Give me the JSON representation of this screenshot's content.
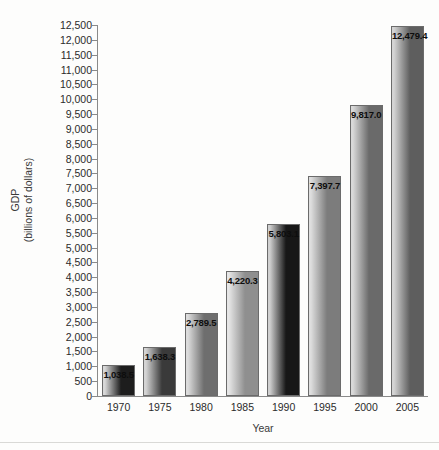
{
  "chart_data": {
    "type": "bar",
    "title": "",
    "xlabel": "Year",
    "ylabel_line1": "GDP",
    "ylabel_line2": "(billions of dollars)",
    "categories": [
      "1970",
      "1975",
      "1980",
      "1985",
      "1990",
      "1995",
      "2000",
      "2005"
    ],
    "values": [
      1038.5,
      1638.3,
      2789.5,
      4220.3,
      5803.1,
      7397.7,
      9817.0,
      12479.4
    ],
    "value_labels": [
      "1,038.5",
      "1,638.3",
      "2,789.5",
      "4,220.3",
      "5,803.1",
      "7,397.7",
      "9,817.0",
      "12,479.4"
    ],
    "ylim": [
      0,
      12500
    ],
    "ytick_step": 500,
    "ytick_labels": [
      "12,500",
      "12,000",
      "11,500",
      "11,000",
      "10,500",
      "10,000",
      "9,500",
      "9,000",
      "8,500",
      "8,000",
      "7,500",
      "7,000",
      "6,500",
      "6,000",
      "5,500",
      "5,000",
      "4,500",
      "4,000",
      "3,500",
      "3,000",
      "2,500",
      "2,000",
      "1,500",
      "1,000",
      "500",
      "0"
    ],
    "ytick_values": [
      12500,
      12000,
      11500,
      11000,
      10500,
      10000,
      9500,
      9000,
      8500,
      8000,
      7500,
      7000,
      6500,
      6000,
      5500,
      5000,
      4500,
      4000,
      3500,
      3000,
      2500,
      2000,
      1500,
      1000,
      500,
      0
    ],
    "grid": false,
    "legend": null,
    "bar_fill_style": "horizontal-gradient-grayscale",
    "bar_colors": [
      {
        "light": "#d8d8d8",
        "dark": "#1d1d1d"
      },
      {
        "light": "#d4d4d4",
        "dark": "#3a3a3a"
      },
      {
        "light": "#dcdcdc",
        "dark": "#6e6e6e"
      },
      {
        "light": "#e6e6e6",
        "dark": "#8f8f8f"
      },
      {
        "light": "#d0d0d0",
        "dark": "#171717"
      },
      {
        "light": "#dedede",
        "dark": "#7c7c7c"
      },
      {
        "light": "#d9d9d9",
        "dark": "#6a6a6a"
      },
      {
        "light": "#d4d4d4",
        "dark": "#5e5e5e"
      }
    ],
    "colors": {
      "axis": "#8a8a8a",
      "bar_border": "#6b6b6b",
      "text": "#2b2b2b",
      "background": "#fdfdfc"
    }
  }
}
